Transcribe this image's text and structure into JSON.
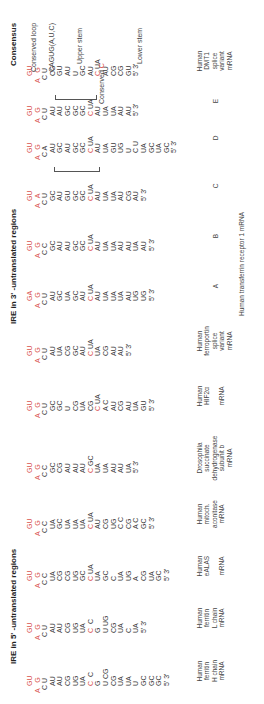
{
  "headers": {
    "five_prime": "IRE in 5' -untranslated regions",
    "three_prime": "IRE in 3' -untranslated regions",
    "consensus": "Consensus"
  },
  "colors": {
    "conserved": "#d9534f",
    "text": "#3a3a3a"
  },
  "structures": [
    {
      "id": "ferritin-h",
      "loop_top": "GU",
      "loop_left": "A",
      "loop_right": "G",
      "lines": [
        "C U",
        "AU",
        "AU",
        "CG",
        "UG",
        "UA",
        "C  C",
        "G",
        "U CG",
        "CG",
        "UA",
        "UA",
        "U",
        "GC",
        "GC",
        "GC",
        "5' 3'"
      ],
      "label": [
        "Human",
        "ferritin",
        "H chain",
        "mRNA"
      ]
    },
    {
      "id": "ferritin-l",
      "loop_top": "GU",
      "loop_left": "A",
      "loop_right": "G",
      "lines": [
        "C U",
        "AU",
        "AU",
        "CG",
        "UG",
        "UA",
        "C  C",
        "G",
        "U UG",
        "CG",
        "UA",
        "C",
        "UA",
        "5' 3'"
      ],
      "label": [
        "Human",
        "ferritin",
        "L chain",
        "mRNA"
      ]
    },
    {
      "id": "ealas",
      "loop_top": "GU",
      "loop_left": "A",
      "loop_right": "G",
      "lines": [
        "C C",
        "UA",
        "CG",
        "CG",
        "UG",
        "GC",
        "C UA",
        "UA",
        "GC",
        "C",
        "UA",
        "UG",
        "A",
        "CG",
        "UA",
        "GC",
        "5' 3'"
      ],
      "label": [
        "Human",
        "eALAS",
        "",
        "mRNA"
      ]
    },
    {
      "id": "aconitase",
      "loop_top": "GU",
      "loop_left": "A",
      "loop_right": "G",
      "lines": [
        "C C",
        "UA",
        "GC",
        "UA",
        "UA",
        "UA",
        "C UA",
        "AU",
        "CG",
        "UG",
        "C C",
        "CG",
        "A C",
        "GC",
        "5' 3'"
      ],
      "label": [
        "Human",
        "mitoch.",
        "aconitase",
        "mRNA"
      ]
    },
    {
      "id": "drosophila-sdh",
      "loop_top": "GU",
      "loop_left": "A",
      "loop_right": "G",
      "lines": [
        "C C",
        "GC",
        "CG",
        "AU",
        "AU",
        "AU",
        "C GC",
        "UA",
        "UA",
        "AU",
        "AU",
        "UA",
        "5' 3'"
      ],
      "label": [
        "Drosophila",
        "succinate",
        "dehydrogenase",
        "subunit b",
        "mRNA"
      ]
    },
    {
      "id": "hif2a",
      "loop_top": "GU",
      "loop_left": "A",
      "loop_right": "G",
      "lines": [
        "C U",
        "GC",
        "GC",
        "U",
        "CG",
        "UA",
        "CG",
        "C UA",
        "A C",
        "AU",
        "CG",
        "AU",
        "UA",
        "GU",
        "5' 3'"
      ],
      "label": [
        "Human",
        "HIF2α",
        "",
        "mRNA"
      ]
    },
    {
      "id": "ferroportin",
      "loop_top": "GU",
      "loop_left": "A",
      "loop_right": "G",
      "lines": [
        "C U",
        "AU",
        "UA",
        "CG",
        "GC",
        "AU",
        "C UA",
        "UA",
        "CG",
        "AU",
        "AU",
        "5' 3'"
      ],
      "label": [
        "Human",
        "ferroportin",
        "splice",
        "variant",
        "mRNA"
      ]
    },
    {
      "id": "tfr-a",
      "loop_top": "GA",
      "loop_left": "A",
      "loop_right": "G",
      "lines": [
        "C U",
        "AU",
        "GC",
        "UA",
        "GC",
        "AU",
        "C UA",
        "AU",
        "UA",
        "UA",
        "UA",
        "AU",
        "UG",
        "UG",
        "5' 3'"
      ],
      "label": [
        "A"
      ]
    },
    {
      "id": "tfr-b",
      "loop_top": "GU",
      "loop_left": "A",
      "loop_right": "G",
      "lines": [
        "C C",
        "GC",
        "AU",
        "AU",
        "GC",
        "GC",
        "C UA",
        "AU",
        "UA",
        "UA",
        "AU",
        "AU",
        "UA",
        "AU",
        "5' 3'"
      ],
      "label": [
        "B"
      ]
    },
    {
      "id": "tfr-c",
      "loop_top": "GU",
      "loop_left": "A",
      "loop_right": "A",
      "lines": [
        "C U",
        "GC",
        "AU",
        "GU",
        "GC",
        "GC",
        "C UA",
        "AU",
        "UA",
        "UA",
        "AU",
        "CG",
        "AU",
        "5' 3'"
      ],
      "label": [
        "C"
      ]
    },
    {
      "id": "tfr-d",
      "loop_top": "GU",
      "loop_left": "A",
      "loop_right": "G",
      "lines": [
        "C A",
        "AU",
        "GC",
        "AU",
        "GC",
        "GC",
        "C UA",
        "AU",
        "UA",
        "GU",
        "UG",
        "U",
        "C U",
        "UA",
        "GC",
        "UA",
        "GC",
        "5' 3'"
      ],
      "label": [
        "D"
      ]
    },
    {
      "id": "tfr-e",
      "loop_top": "GU",
      "loop_left": "A",
      "loop_right": "G",
      "lines": [
        "C U",
        "AU",
        "AU",
        "GC",
        "GC",
        "GC",
        "C UA",
        "AU",
        "UA",
        "UA",
        "AU",
        "AU",
        "5' 3'"
      ],
      "label": [
        "E"
      ]
    },
    {
      "id": "dmt1",
      "loop_top": "GU",
      "loop_left": "A",
      "loop_right": "G",
      "lines": [
        "C U",
        "CG",
        "GU",
        "AU",
        "U",
        "GC",
        "AU",
        "C UA",
        "AU",
        "CG",
        "CG",
        "GU",
        "5' 3'"
      ],
      "label": [
        "Human",
        "DMT1",
        "splice",
        "variant",
        "mRNA"
      ]
    }
  ],
  "tfr_group_label": "Human transferrin receptor 1 mRNA",
  "consensus": {
    "conserved_loop": "Conserved loop",
    "loop_seq": "CAGUG(A,U,C)",
    "upper_stem": "Upper stem",
    "conserved_c_label": "Conserved",
    "conserved_c": "C",
    "lower_stem": "Lower stem"
  }
}
